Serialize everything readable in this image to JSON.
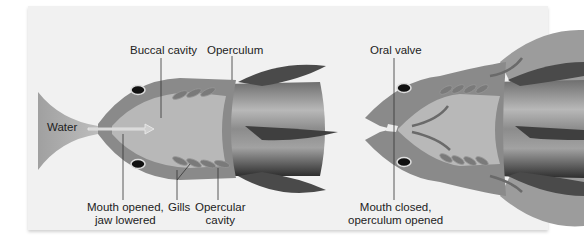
{
  "diagram": {
    "left_panel": {
      "labels": {
        "buccal_cavity": "Buccal cavity",
        "operculum": "Operculum",
        "water": "Water",
        "mouth_opened_line1": "Mouth opened,",
        "mouth_opened_line2": "jaw lowered",
        "gills": "Gills",
        "opercular_cavity_line1": "Opercular",
        "opercular_cavity_line2": "cavity"
      }
    },
    "right_panel": {
      "labels": {
        "oral_valve": "Oral valve",
        "mouth_closed_line1": "Mouth closed,",
        "mouth_closed_line2": "operculum opened"
      }
    },
    "colors": {
      "background": "#f1f1f1",
      "body_outer": "#8a8a8a",
      "body_inner": "#b5b5b5",
      "water": "#a9a9a9",
      "fin": "#4a4a4a",
      "gill": "#7d7d7d"
    }
  }
}
